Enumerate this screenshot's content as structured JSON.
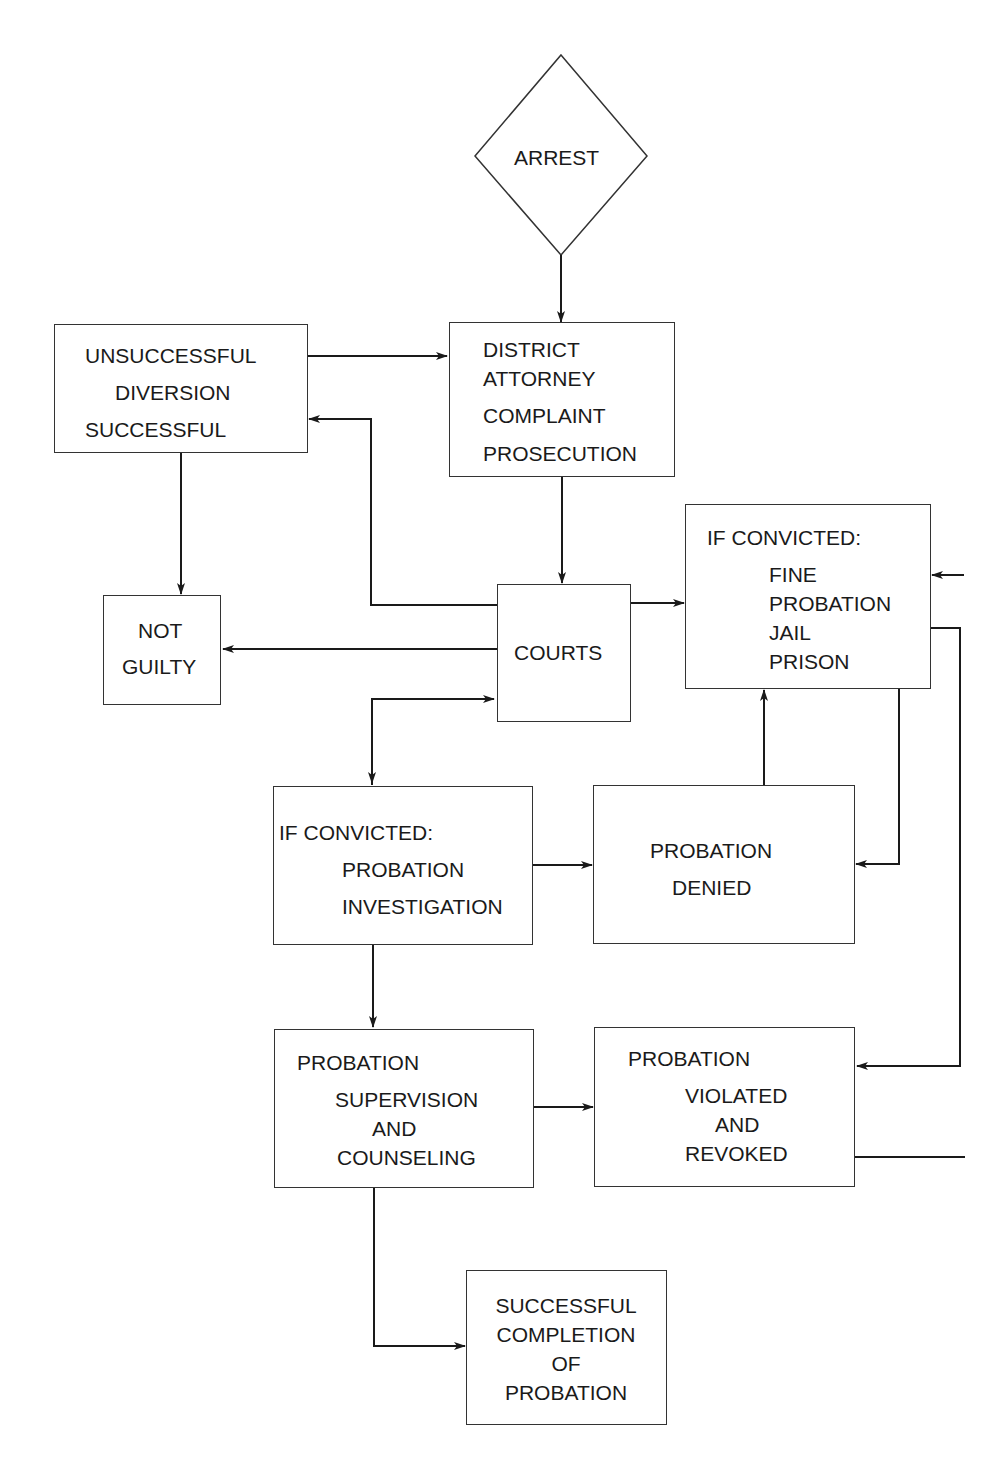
{
  "diagram": {
    "type": "flowchart",
    "nodes": {
      "arrest": {
        "label": "ARREST"
      },
      "diversion": {
        "lines": [
          "UNSUCCESSFUL",
          "DIVERSION",
          "SUCCESSFUL"
        ]
      },
      "district_attorney": {
        "lines": [
          "DISTRICT",
          "ATTORNEY",
          "COMPLAINT",
          "PROSECUTION"
        ]
      },
      "not_guilty": {
        "lines": [
          "NOT",
          "GUILTY"
        ]
      },
      "courts": {
        "label": "COURTS"
      },
      "sentence": {
        "lines": [
          "IF CONVICTED:",
          "FINE",
          "PROBATION",
          "JAIL",
          "PRISON"
        ]
      },
      "probation_investigation": {
        "lines": [
          "IF CONVICTED:",
          "PROBATION",
          "INVESTIGATION"
        ]
      },
      "probation_denied": {
        "lines": [
          "PROBATION",
          "DENIED"
        ]
      },
      "probation_supervision": {
        "lines": [
          "PROBATION",
          "SUPERVISION",
          "AND",
          "COUNSELING"
        ]
      },
      "probation_revoked": {
        "lines": [
          "PROBATION",
          "VIOLATED",
          "AND",
          "REVOKED"
        ]
      },
      "successful_completion": {
        "lines": [
          "SUCCESSFUL",
          "COMPLETION",
          "OF",
          "PROBATION"
        ]
      }
    },
    "edges": [
      {
        "from": "arrest",
        "to": "district_attorney"
      },
      {
        "from": "diversion",
        "to": "district_attorney"
      },
      {
        "from": "courts",
        "to": "diversion"
      },
      {
        "from": "diversion",
        "to": "not_guilty"
      },
      {
        "from": "district_attorney",
        "to": "courts"
      },
      {
        "from": "courts",
        "to": "not_guilty"
      },
      {
        "from": "courts",
        "to": "sentence"
      },
      {
        "from": "courts",
        "to": "probation_investigation"
      },
      {
        "from": "probation_investigation",
        "to": "courts"
      },
      {
        "from": "probation_investigation",
        "to": "probation_denied"
      },
      {
        "from": "probation_denied",
        "to": "sentence"
      },
      {
        "from": "sentence",
        "to": "probation_denied"
      },
      {
        "from": "sentence",
        "to": "probation_revoked"
      },
      {
        "from": "probation_revoked",
        "to": "sentence"
      },
      {
        "from": "probation_investigation",
        "to": "probation_supervision"
      },
      {
        "from": "probation_supervision",
        "to": "probation_revoked"
      },
      {
        "from": "probation_supervision",
        "to": "successful_completion"
      }
    ]
  },
  "colors": {
    "line": "#1a1a1a",
    "background": "#ffffff"
  }
}
